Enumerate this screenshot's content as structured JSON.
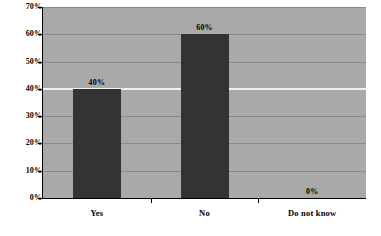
{
  "chart_data": {
    "type": "bar",
    "title": "",
    "subtitle": "",
    "xlabel": "",
    "ylabel": "",
    "categories": [
      "Yes",
      "No",
      "Do not know"
    ],
    "values": [
      40,
      60,
      0
    ],
    "data_labels": [
      "40%",
      "60%",
      "0%"
    ],
    "ylim": [
      0,
      70
    ],
    "ytick_values": [
      0,
      10,
      20,
      30,
      40,
      50,
      60,
      70
    ],
    "ytick_labels": [
      "0%",
      "10%",
      "20%",
      "30%",
      "40%",
      "50%",
      "60%",
      "70%"
    ],
    "grid": true,
    "legend": "none",
    "series": [
      {
        "name": "",
        "values": [
          40,
          60,
          0
        ]
      }
    ],
    "colors": {
      "bar": "#333333",
      "plot_background": "#a9a9a9",
      "gridline": "#8a8a8a",
      "gridline_highlight": "#f2f2f2",
      "axis": "#000000",
      "text": "#000000",
      "page_background": "#ffffff"
    }
  }
}
